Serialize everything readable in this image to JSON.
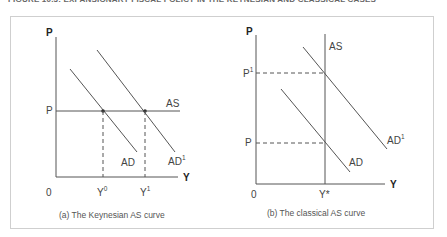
{
  "figure": {
    "title": "FIGURE 10.3: EXPANSIONARY FISCAL POLICY IN THE KEYNESIAN AND CLASSICAL CASES"
  },
  "panels": [
    {
      "id": "keynesian",
      "caption": "(a) The Keynesian AS curve",
      "y_axis_label": "P",
      "x_axis_label": "Y",
      "origin_label": "0",
      "price_label": "P",
      "curves": {
        "as": "AS",
        "ad": "AD",
        "ad1_base": "AD",
        "ad1_sup": "1"
      },
      "x_ticks": [
        {
          "base": "Y",
          "sup": "0"
        },
        {
          "base": "Y",
          "sup": "1"
        }
      ]
    },
    {
      "id": "classical",
      "caption": "(b) The classical AS curve",
      "y_axis_label": "P",
      "x_axis_label": "Y",
      "origin_label": "0",
      "price_labels": [
        {
          "base": "P",
          "sup": "1"
        },
        {
          "base": "P",
          "sup": ""
        }
      ],
      "curves": {
        "as": "AS",
        "ad": "AD",
        "ad1_base": "AD",
        "ad1_sup": "1"
      },
      "x_tick": "Y*"
    }
  ]
}
